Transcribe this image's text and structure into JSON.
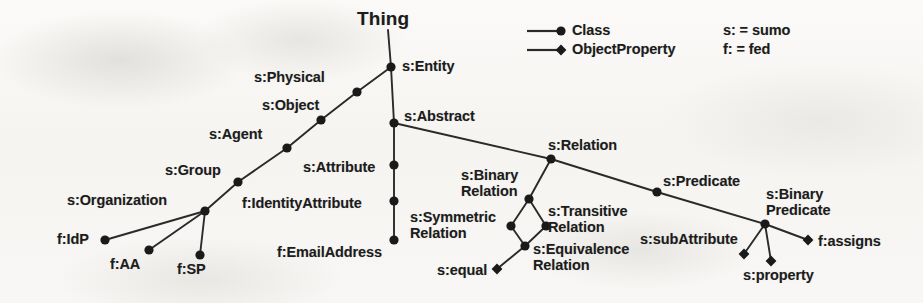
{
  "diagram": {
    "title": "Thing",
    "background_color": "#f7f6f4",
    "stroke_color": "#2a2a2a",
    "node_fill_color": "#1a1a1a",
    "legend": {
      "class_label": "Class",
      "object_property_label": "ObjectProperty",
      "prefix_sumo": "s: = sumo",
      "prefix_fed": "f: = fed",
      "class_marker": "circle-marker-icon",
      "object_property_marker": "diamond-marker-icon"
    },
    "nodes": [
      {
        "id": "entity",
        "label": "s:Entity",
        "kind": "class",
        "x": 391,
        "y": 67,
        "label_x": 402,
        "label_y": 59,
        "align": "left"
      },
      {
        "id": "physical",
        "label": "s:Physical",
        "kind": "class",
        "x": 357,
        "y": 92,
        "label_x": 254,
        "label_y": 70,
        "align": "left"
      },
      {
        "id": "object",
        "label": "s:Object",
        "kind": "class",
        "x": 321,
        "y": 120,
        "label_x": 262,
        "label_y": 98,
        "align": "left"
      },
      {
        "id": "agent",
        "label": "s:Agent",
        "kind": "class",
        "x": 287,
        "y": 148,
        "label_x": 209,
        "label_y": 127,
        "align": "left"
      },
      {
        "id": "group",
        "label": "s:Group",
        "kind": "class",
        "x": 238,
        "y": 182,
        "label_x": 165,
        "label_y": 163,
        "align": "left"
      },
      {
        "id": "organization",
        "label": "s:Organization",
        "kind": "class",
        "x": 205,
        "y": 211,
        "label_x": 67,
        "label_y": 193,
        "align": "left"
      },
      {
        "id": "idp",
        "label": "f:IdP",
        "kind": "class",
        "x": 105,
        "y": 240,
        "label_x": 57,
        "label_y": 232,
        "align": "right"
      },
      {
        "id": "aa",
        "label": "f:AA",
        "kind": "class",
        "x": 149,
        "y": 250,
        "label_x": 110,
        "label_y": 257,
        "align": "left"
      },
      {
        "id": "sp",
        "label": "f:SP",
        "kind": "class",
        "x": 200,
        "y": 255,
        "label_x": 177,
        "label_y": 262,
        "align": "left"
      },
      {
        "id": "abstract",
        "label": "s:Abstract",
        "kind": "class",
        "x": 394,
        "y": 123,
        "label_x": 404,
        "label_y": 109,
        "align": "left"
      },
      {
        "id": "attribute",
        "label": "s:Attribute",
        "kind": "class",
        "x": 394,
        "y": 165,
        "label_x": 303,
        "label_y": 160,
        "align": "right"
      },
      {
        "id": "identityattribute",
        "label": "f:IdentityAttribute",
        "kind": "class",
        "x": 394,
        "y": 201,
        "label_x": 242,
        "label_y": 196,
        "align": "right"
      },
      {
        "id": "emailaddress",
        "label": "f:EmailAddress",
        "kind": "class",
        "x": 394,
        "y": 240,
        "label_x": 277,
        "label_y": 245,
        "align": "right"
      },
      {
        "id": "relation",
        "label": "s:Relation",
        "kind": "class",
        "x": 551,
        "y": 159,
        "label_x": 548,
        "label_y": 138,
        "align": "left"
      },
      {
        "id": "binaryrelation",
        "label": "s:Binary\nRelation",
        "kind": "class",
        "x": 529,
        "y": 199,
        "label_x": 461,
        "label_y": 167,
        "align": "left"
      },
      {
        "id": "symmetricrelation",
        "label": "s:Symmetric\nRelation",
        "kind": "class",
        "x": 511,
        "y": 226,
        "label_x": 410,
        "label_y": 209,
        "align": "left"
      },
      {
        "id": "transitiverelation",
        "label": "s:Transitive\nRelation",
        "kind": "class",
        "x": 546,
        "y": 226,
        "label_x": 548,
        "label_y": 203,
        "align": "left"
      },
      {
        "id": "equivalencerelation",
        "label": "s:Equivalence\nRelation",
        "kind": "class",
        "x": 525,
        "y": 246,
        "label_x": 533,
        "label_y": 241,
        "align": "left"
      },
      {
        "id": "equal",
        "label": "s:equal",
        "kind": "object-property",
        "x": 497,
        "y": 269,
        "label_x": 437,
        "label_y": 263,
        "align": "right"
      },
      {
        "id": "predicate",
        "label": "s:Predicate",
        "kind": "class",
        "x": 657,
        "y": 192,
        "label_x": 663,
        "label_y": 174,
        "align": "left"
      },
      {
        "id": "binarypredicate",
        "label": "s:Binary\nPredicate",
        "kind": "class",
        "x": 765,
        "y": 224,
        "label_x": 766,
        "label_y": 186,
        "align": "left"
      },
      {
        "id": "subattribute",
        "label": "s:subAttribute",
        "kind": "object-property",
        "x": 744,
        "y": 254,
        "label_x": 640,
        "label_y": 232,
        "align": "left"
      },
      {
        "id": "property",
        "label": "s:property",
        "kind": "object-property",
        "x": 771,
        "y": 261,
        "label_x": 743,
        "label_y": 268,
        "align": "left"
      },
      {
        "id": "assigns",
        "label": "f:assigns",
        "kind": "object-property",
        "x": 808,
        "y": 240,
        "label_x": 818,
        "label_y": 234,
        "align": "left"
      }
    ],
    "edges": [
      {
        "from": "thing-root",
        "to": "entity"
      },
      {
        "from": "entity",
        "to": "physical"
      },
      {
        "from": "physical",
        "to": "object"
      },
      {
        "from": "object",
        "to": "agent"
      },
      {
        "from": "agent",
        "to": "group"
      },
      {
        "from": "group",
        "to": "organization"
      },
      {
        "from": "organization",
        "to": "idp"
      },
      {
        "from": "organization",
        "to": "aa"
      },
      {
        "from": "organization",
        "to": "sp"
      },
      {
        "from": "entity",
        "to": "abstract"
      },
      {
        "from": "abstract",
        "to": "attribute"
      },
      {
        "from": "attribute",
        "to": "identityattribute"
      },
      {
        "from": "identityattribute",
        "to": "emailaddress"
      },
      {
        "from": "abstract",
        "to": "relation"
      },
      {
        "from": "relation",
        "to": "binaryrelation"
      },
      {
        "from": "binaryrelation",
        "to": "symmetricrelation"
      },
      {
        "from": "binaryrelation",
        "to": "transitiverelation"
      },
      {
        "from": "symmetricrelation",
        "to": "equivalencerelation"
      },
      {
        "from": "transitiverelation",
        "to": "equivalencerelation"
      },
      {
        "from": "equivalencerelation",
        "to": "equal"
      },
      {
        "from": "relation",
        "to": "predicate"
      },
      {
        "from": "predicate",
        "to": "binarypredicate"
      },
      {
        "from": "binarypredicate",
        "to": "subattribute"
      },
      {
        "from": "binarypredicate",
        "to": "property"
      },
      {
        "from": "binarypredicate",
        "to": "assigns"
      }
    ]
  }
}
